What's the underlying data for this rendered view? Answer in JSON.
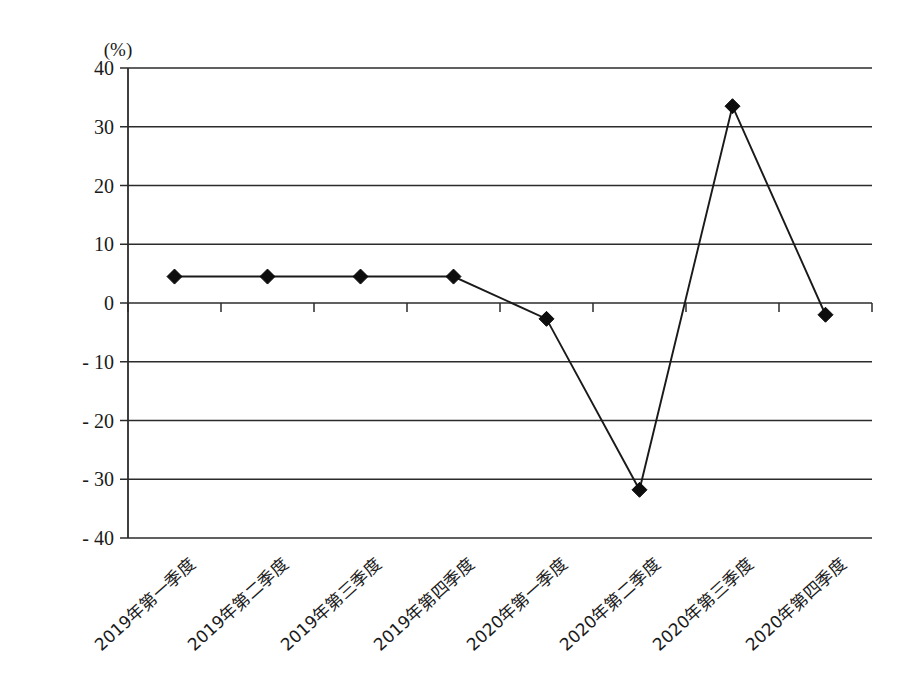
{
  "chart_data": {
    "type": "line",
    "title": "",
    "subtitle": "",
    "xlabel": "",
    "ylabel": "",
    "unit_label": "(%)",
    "ylim": [
      -40,
      40
    ],
    "ytick_step": 10,
    "grid": true,
    "legend": "none",
    "marker": "diamond",
    "categories": [
      "2019年第一季度",
      "2019年第二季度",
      "2019年第三季度",
      "2019年第四季度",
      "2020年第一季度",
      "2020年第二季度",
      "2020年第三季度",
      "2020年第四季度"
    ],
    "values": [
      4.5,
      4.5,
      4.5,
      4.5,
      -2.7,
      -31.8,
      33.5,
      -2.0
    ],
    "ytick_labels": [
      "40",
      "30",
      "20",
      "10",
      "0",
      "- 10",
      "- 20",
      "- 30",
      "- 40"
    ],
    "ytick_values": [
      40,
      30,
      20,
      10,
      0,
      -10,
      -20,
      -30,
      -40
    ],
    "series": [
      {
        "name": "",
        "values": [
          4.5,
          4.5,
          4.5,
          4.5,
          -2.7,
          -31.8,
          33.5,
          -2.0
        ]
      }
    ],
    "colors": {
      "line": "#1a1a1a",
      "marker": "#0d0d0d",
      "grid": "#2b2b2b",
      "background": "#ffffff"
    }
  }
}
